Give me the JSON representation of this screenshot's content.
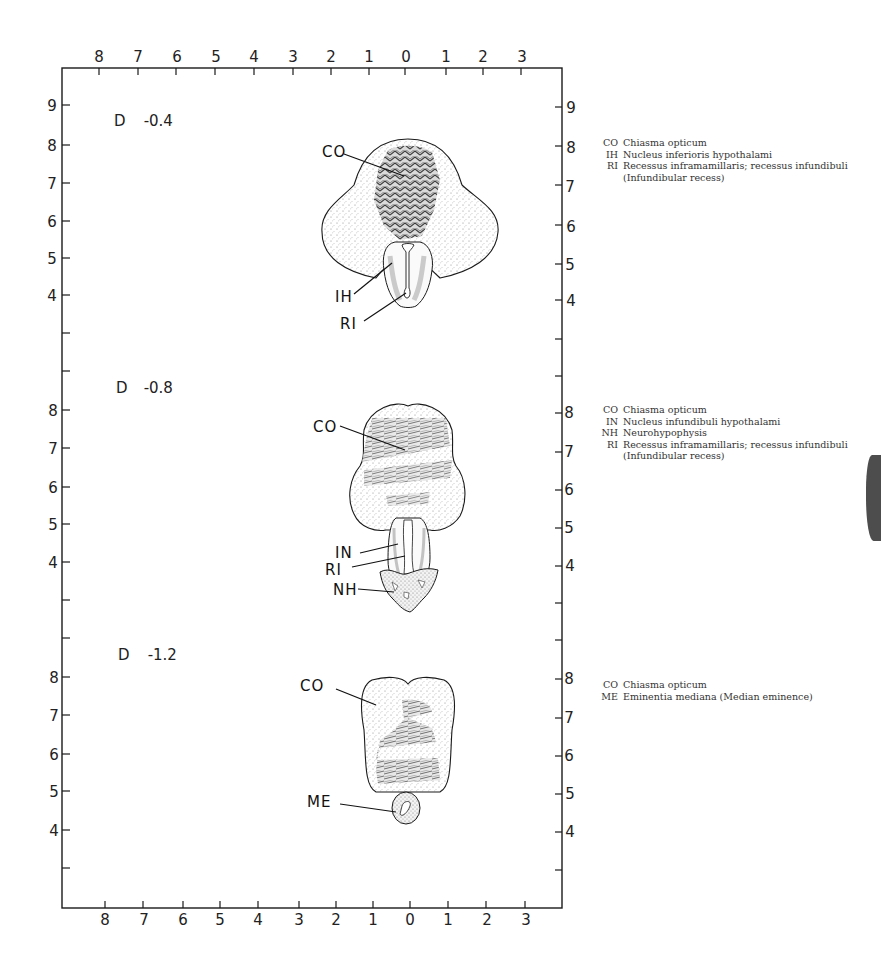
{
  "figure": {
    "x_axis_ticks": [
      "8",
      "7",
      "6",
      "5",
      "4",
      "3",
      "2",
      "1",
      "0",
      "1",
      "2",
      "3"
    ],
    "panels": [
      {
        "level_prefix": "D",
        "level_value": "-0.4",
        "y_axis_ticks": [
          "9",
          "8",
          "7",
          "6",
          "5",
          "4"
        ],
        "structure_labels": [
          "CO",
          "IH",
          "RI"
        ],
        "legend": [
          {
            "abbr": "CO",
            "text": "Chiasma opticum"
          },
          {
            "abbr": "IH",
            "text": "Nucleus inferioris hypothalami"
          },
          {
            "abbr": "RI",
            "text": "Recessus inframamillaris; recessus infundibuli"
          },
          {
            "abbr": "",
            "text": "(Infundibular recess)"
          }
        ]
      },
      {
        "level_prefix": "D",
        "level_value": "-0.8",
        "y_axis_ticks": [
          "8",
          "7",
          "6",
          "5",
          "4"
        ],
        "structure_labels": [
          "CO",
          "IN",
          "RI",
          "NH"
        ],
        "legend": [
          {
            "abbr": "CO",
            "text": "Chiasma opticum"
          },
          {
            "abbr": "IN",
            "text": "Nucleus infundibuli hypothalami"
          },
          {
            "abbr": "NH",
            "text": "Neurohypophysis"
          },
          {
            "abbr": "RI",
            "text": "Recessus inframamillaris; recessus infundibuli"
          },
          {
            "abbr": "",
            "text": "(Infundibular recess)"
          }
        ]
      },
      {
        "level_prefix": "D",
        "level_value": "-1.2",
        "y_axis_ticks": [
          "8",
          "7",
          "6",
          "5",
          "4"
        ],
        "structure_labels": [
          "CO",
          "ME"
        ],
        "legend": [
          {
            "abbr": "CO",
            "text": "Chiasma opticum"
          },
          {
            "abbr": "ME",
            "text": "Eminentia mediana (Median eminence)"
          }
        ]
      }
    ]
  },
  "colors": {
    "ink": "#1a1a1a",
    "stipple": "#9a9a9a",
    "fiber_dark": "#3a3a3a",
    "paper": "#ffffff"
  }
}
